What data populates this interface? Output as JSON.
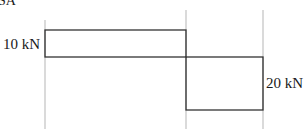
{
  "diagram": {
    "type": "shear-force-diagram",
    "corner_label": "SA",
    "segments": [
      {
        "name": "left",
        "value_kN": 10,
        "sign": "positive",
        "label": "10 kN"
      },
      {
        "name": "right",
        "value_kN": -20,
        "sign": "negative",
        "label": "20 kN"
      }
    ],
    "colors": {
      "outline": "#333333",
      "guide": "#b5b5b5",
      "text": "#1a1a1a"
    }
  }
}
